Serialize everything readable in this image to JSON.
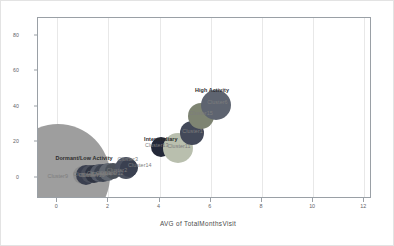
{
  "chart_data": {
    "type": "scatter",
    "title": "",
    "xlabel": "AVG of TotalMonthsVisit",
    "ylabel": "",
    "xlim": [
      -0.75,
      12.3
    ],
    "ylim": [
      -12,
      90
    ],
    "xticks": [
      "0",
      "2",
      "4",
      "6",
      "8",
      "10",
      "12"
    ],
    "xtick_values": [
      0,
      2,
      4,
      6,
      8,
      10,
      12
    ],
    "yticks": [
      "0",
      "20",
      "40",
      "60",
      "80"
    ],
    "ytick_values": [
      0,
      20,
      40,
      60,
      80
    ],
    "grid": "vertical",
    "legend": "none",
    "points": [
      {
        "label": "Cluster9",
        "x": 0.02,
        "y": 1.0,
        "size": 52,
        "color": "#9e9e9e",
        "label_dx": 0,
        "label_dy": 0
      },
      {
        "label": "Cluster8",
        "x": 0.95,
        "y": 1.6,
        "size": 9,
        "color": "#8f8f8f",
        "label_dx": 2,
        "label_dy": -1
      },
      {
        "label": "Cluster7",
        "x": 1.12,
        "y": 1.8,
        "size": 10,
        "color": "#3a3f4f",
        "label_dx": 3,
        "label_dy": 0
      },
      {
        "label": "Cluster10",
        "x": 1.28,
        "y": 2.0,
        "size": 9,
        "color": "#4a4f5c",
        "label_dx": 3,
        "label_dy": 1
      },
      {
        "label": "Cluster5",
        "x": 1.45,
        "y": 2.2,
        "size": 9,
        "color": "#2f3442",
        "label_dx": 3,
        "label_dy": -1
      },
      {
        "label": "Cluster4",
        "x": 1.62,
        "y": 2.5,
        "size": 9,
        "color": "#555b68",
        "label_dx": 3,
        "label_dy": 1
      },
      {
        "label": "Cluster0",
        "x": 1.8,
        "y": 2.8,
        "size": 9,
        "color": "#3d4350",
        "label_dx": 3,
        "label_dy": 0
      },
      {
        "label": "Cluster12",
        "x": 1.98,
        "y": 3.2,
        "size": 9,
        "color": "#60666f",
        "label_dx": 4,
        "label_dy": 1
      },
      {
        "label": "Cluster2",
        "x": 2.18,
        "y": 3.6,
        "size": 8,
        "color": "#4b5159",
        "label_dx": 4,
        "label_dy": -1
      },
      {
        "label": "Cluster3",
        "x": 2.68,
        "y": 5.2,
        "size": 11,
        "color": "#4c5260",
        "label_dx": 2,
        "label_dy": -9
      },
      {
        "label": "Cluster14",
        "x": 2.8,
        "y": 5.4,
        "size": 9,
        "color": "#3a4050",
        "label_dx": 11,
        "label_dy": -3
      },
      {
        "label": "Cluster13",
        "x": 4.05,
        "y": 17.4,
        "size": 10,
        "color": "#232838",
        "label_dx": -4,
        "label_dy": -2
      },
      {
        "label": "Cluster11",
        "x": 4.72,
        "y": 17.0,
        "size": 15,
        "color": "#b9bfae",
        "label_dx": 1,
        "label_dy": -2
      },
      {
        "label": "Cluster1",
        "x": 5.25,
        "y": 25.2,
        "size": 12,
        "color": "#434959",
        "label_dx": 1,
        "label_dy": -2
      },
      {
        "label": "Cluster15",
        "x": 5.62,
        "y": 34.6,
        "size": 13,
        "color": "#7e8472",
        "label_dx": 0,
        "label_dy": -3
      },
      {
        "label": "Cluster6",
        "x": 6.22,
        "y": 41.2,
        "size": 15,
        "color": "#5e6470",
        "label_dx": 1,
        "label_dy": -3
      }
    ],
    "annotations": [
      {
        "text": "Dormant/Low Activity",
        "x": 1.05,
        "y": 11.0
      },
      {
        "text": "Intermediary",
        "x": 4.05,
        "y": 22.0
      },
      {
        "text": "High Activity",
        "x": 6.05,
        "y": 49.5
      }
    ]
  }
}
